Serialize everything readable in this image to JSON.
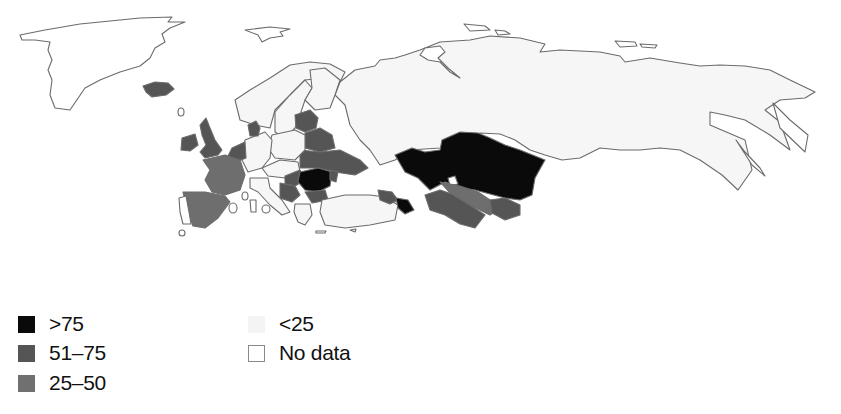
{
  "map": {
    "region": "Europe and Northern Asia",
    "colors": {
      "gt75": "#0a0a0a",
      "51_75": "#555555",
      "25_50": "#6e6e6e",
      "lt25": "#f6f6f6",
      "no_data": "#ffffff",
      "border": "#6b6b6b"
    },
    "categories": {
      "gt75": [
        "Kazakhstan",
        "Uzbekistan (north)",
        "Romania",
        "Azerbaijan"
      ],
      "51_75": [
        "Iceland",
        "United Kingdom",
        "Ireland",
        "Denmark",
        "Belgium/Netherlands",
        "Baltic states",
        "Belarus",
        "Ukraine",
        "Moldova",
        "Bulgaria",
        "Serbia",
        "Hungary",
        "Georgia",
        "Turkmenistan",
        "Tajikistan",
        "Kyrgyzstan"
      ],
      "25_50": [
        "France",
        "Spain",
        "Uzbekistan"
      ],
      "lt25": [
        "Russia",
        "Norway",
        "Sweden",
        "Finland",
        "Germany",
        "Poland",
        "Czechia",
        "Austria",
        "Switzerland",
        "Italy",
        "Greece",
        "Turkey"
      ],
      "no_data": [
        "Greenland",
        "Portugal"
      ]
    }
  },
  "legend": {
    "items": [
      {
        "key": "gt75",
        "label": ">75",
        "color": "#0a0a0a"
      },
      {
        "key": "51_75",
        "label": "51–75",
        "color": "#555555"
      },
      {
        "key": "25_50",
        "label": "25–50",
        "color": "#707070"
      },
      {
        "key": "lt25",
        "label": "<25",
        "color": "#f4f4f4"
      },
      {
        "key": "no_data",
        "label": "No data",
        "color": "#ffffff"
      }
    ]
  }
}
